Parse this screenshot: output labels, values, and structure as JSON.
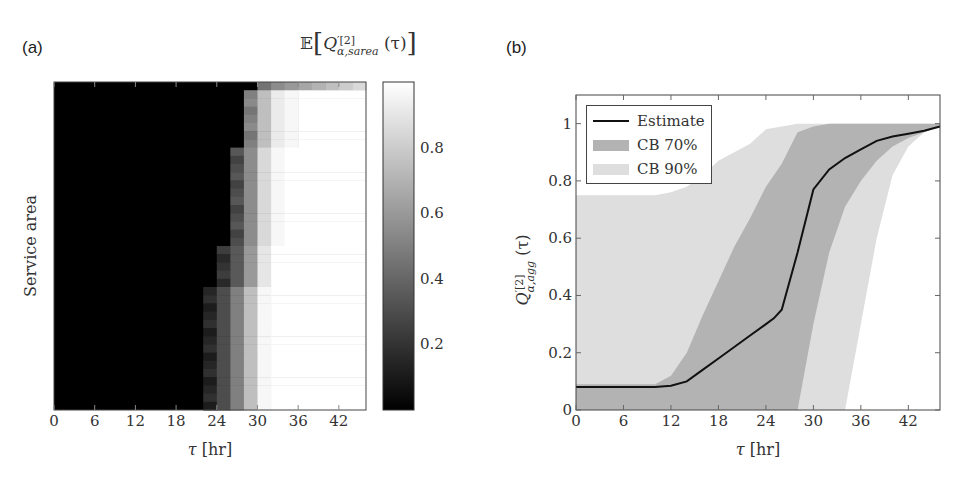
{
  "panels": {
    "a": {
      "label": "(a)",
      "colorbar_title": "𝔼[Q′[2]α,sarea(τ)]",
      "colorbar_title_parts": {
        "prefix": "𝔼",
        "Q": "Q",
        "sup": "′[2]",
        "sub": "α,sarea",
        "arg": "(τ)"
      },
      "ylabel": "Service area",
      "xlabel": "τ [hr]",
      "colorbar_ticks": [
        "0.2",
        "0.4",
        "0.6",
        "0.8"
      ]
    },
    "b": {
      "label": "(b)",
      "ylabel_parts": {
        "Q": "Q",
        "sup": "′[2]",
        "sub": "α,agg",
        "arg": "(τ)"
      },
      "xlabel": "τ [hr]",
      "legend": [
        {
          "label": "Estimate",
          "kind": "line",
          "color": "#111111"
        },
        {
          "label": "CB 70%",
          "kind": "area",
          "color": "#b3b3b3"
        },
        {
          "label": "CB 90%",
          "kind": "area",
          "color": "#dedede"
        }
      ]
    }
  },
  "chart_data": [
    {
      "type": "heatmap",
      "title": "",
      "panel": "(a)",
      "xlabel": "τ [hr]",
      "ylabel": "Service area",
      "colorbar_label": "E[Q'[2]_{α,sarea}(τ)]",
      "x_ticks": [
        0,
        6,
        12,
        18,
        24,
        30,
        36,
        42
      ],
      "xlim": [
        0,
        46
      ],
      "colorbar_ticks": [
        0.2,
        0.4,
        0.6,
        0.8
      ],
      "colorbar_range": [
        0,
        1
      ],
      "colormap": "gray (black=0, white=1)",
      "cell_width_hr": 2,
      "description": "Each row is a service area; values ~0 (black) before τ≈22–28 hr, then rise to ~1 (white) by τ≈30–32 hr. Top row transitions earliest to mid-gray around τ≈30 and stays gray (~0.6–0.8).",
      "row_transitions": [
        {
          "rows": "top (1)",
          "dark_until_hr": 30,
          "values_after": [
            0.45,
            0.55,
            0.6,
            0.65,
            0.7,
            0.75,
            0.8,
            0.85
          ]
        },
        {
          "rows": "upper (2-8)",
          "dark_until_hr": 28,
          "values_after": [
            0.5,
            0.75,
            0.92,
            0.97,
            1.0
          ]
        },
        {
          "rows": "middle (9-20)",
          "dark_until_hr": 26,
          "values_after": [
            0.3,
            0.55,
            0.85,
            0.97,
            1.0
          ]
        },
        {
          "rows": "lower (21-25)",
          "dark_until_hr": 24,
          "values_after": [
            0.2,
            0.35,
            0.6,
            0.9,
            1.0
          ]
        },
        {
          "rows": "bottom (26-40)",
          "dark_until_hr": 22,
          "values_after": [
            0.15,
            0.3,
            0.5,
            0.75,
            0.97,
            1.0
          ]
        }
      ]
    },
    {
      "type": "line",
      "panel": "(b)",
      "title": "",
      "xlabel": "τ [hr]",
      "ylabel": "Q'[2]_{α,agg}(τ)",
      "xlim": [
        0,
        46
      ],
      "ylim": [
        0,
        1.1
      ],
      "x_ticks": [
        0,
        6,
        12,
        18,
        24,
        30,
        36,
        42
      ],
      "y_ticks": [
        0,
        0.2,
        0.4,
        0.6,
        0.8,
        1
      ],
      "legend_position": "upper left",
      "grid": false,
      "series": [
        {
          "name": "Estimate",
          "x": [
            0,
            6,
            10,
            12,
            14,
            16,
            18,
            20,
            22,
            24,
            25,
            26,
            28,
            30,
            32,
            34,
            36,
            38,
            40,
            42,
            44,
            46
          ],
          "y": [
            0.08,
            0.08,
            0.08,
            0.085,
            0.1,
            0.14,
            0.18,
            0.22,
            0.26,
            0.3,
            0.32,
            0.35,
            0.55,
            0.77,
            0.84,
            0.88,
            0.91,
            0.94,
            0.955,
            0.965,
            0.975,
            0.99
          ]
        },
        {
          "name": "CB 70%",
          "x": [
            0,
            6,
            10,
            12,
            14,
            16,
            18,
            20,
            22,
            24,
            26,
            28,
            30,
            32,
            34,
            36,
            38,
            40,
            42,
            44,
            46
          ],
          "upper": [
            0.09,
            0.09,
            0.09,
            0.12,
            0.2,
            0.33,
            0.45,
            0.57,
            0.67,
            0.78,
            0.86,
            0.97,
            0.99,
            1.0,
            1.0,
            1.0,
            1.0,
            1.0,
            1.0,
            1.0,
            1.0
          ],
          "lower": [
            0.0,
            0.0,
            0.0,
            0.0,
            0.0,
            0.0,
            0.0,
            0.0,
            0.0,
            0.0,
            0.0,
            0.0,
            0.3,
            0.55,
            0.71,
            0.8,
            0.87,
            0.92,
            0.95,
            0.97,
            0.99
          ]
        },
        {
          "name": "CB 90%",
          "x": [
            0,
            6,
            10,
            12,
            14,
            16,
            18,
            20,
            22,
            24,
            26,
            28,
            30,
            32,
            34,
            36,
            38,
            40,
            42,
            44,
            46
          ],
          "upper": [
            0.75,
            0.75,
            0.75,
            0.76,
            0.78,
            0.82,
            0.87,
            0.9,
            0.93,
            0.98,
            0.99,
            1.0,
            1.0,
            1.0,
            1.0,
            1.0,
            1.0,
            1.0,
            1.0,
            1.0,
            1.0
          ],
          "lower": [
            0.0,
            0.0,
            0.0,
            0.0,
            0.0,
            0.0,
            0.0,
            0.0,
            0.0,
            0.0,
            0.0,
            0.0,
            0.0,
            0.0,
            0.0,
            0.3,
            0.6,
            0.82,
            0.92,
            0.97,
            0.99
          ]
        }
      ]
    }
  ]
}
